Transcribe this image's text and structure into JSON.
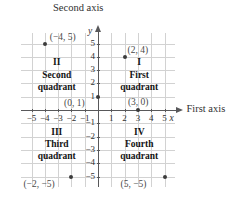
{
  "figure": {
    "type": "cartesian-coordinate-plane",
    "axis_titles": {
      "horizontal": "First axis",
      "vertical": "Second axis"
    },
    "axis_variables": {
      "horizontal": "x",
      "vertical": "y"
    }
  },
  "chart_data": {
    "type": "scatter",
    "title": "",
    "xlabel": "First axis",
    "ylabel": "Second axis",
    "x_variable": "x",
    "y_variable": "y",
    "xlim": [
      -5.8,
      5.8
    ],
    "ylim": [
      -5.8,
      5.8
    ],
    "grid": true,
    "legend": "none",
    "xticks": [
      -5,
      -4,
      -3,
      -2,
      -1,
      1,
      2,
      3,
      4,
      5
    ],
    "yticks": [
      5,
      4,
      3,
      2,
      1,
      -1,
      -2,
      -3,
      -4,
      -5
    ],
    "xtick_labels": [
      "−5",
      "−4",
      "−3",
      "−2",
      "−1",
      "1",
      "2",
      "3",
      "4",
      "5"
    ],
    "ytick_labels": [
      "5",
      "4",
      "3",
      "2",
      "1",
      "−1",
      "−2",
      "−3",
      "−4",
      "−5"
    ],
    "points": [
      {
        "x": -4,
        "y": 5,
        "label": "(−4, 5)",
        "label_pos": "right"
      },
      {
        "x": 2,
        "y": 4,
        "label": "(2, 4)",
        "label_pos": "upper-right"
      },
      {
        "x": 0,
        "y": 1,
        "label": "(0, 1)",
        "label_pos": "lower-left"
      },
      {
        "x": 3,
        "y": 0,
        "label": "(3, 0)",
        "label_pos": "upper-right"
      },
      {
        "x": -2,
        "y": -5,
        "label": "(−2, −5)",
        "label_pos": "lower-left"
      },
      {
        "x": 5,
        "y": -5,
        "label": "(5, −5)",
        "label_pos": "lower-left"
      }
    ],
    "annotations": [
      {
        "name": "quadrant-1",
        "numeral": "I",
        "line2": "First",
        "line3": "quadrant",
        "x": 3.1,
        "y": 2.6
      },
      {
        "name": "quadrant-2",
        "numeral": "II",
        "line2": "Second",
        "line3": "quadrant",
        "x": -3.1,
        "y": 2.6
      },
      {
        "name": "quadrant-3",
        "numeral": "III",
        "line2": "Third",
        "line3": "quadrant",
        "x": -3.1,
        "y": -2.6
      },
      {
        "name": "quadrant-4",
        "numeral": "IV",
        "line2": "Fourth",
        "line3": "quadrant",
        "x": 3.1,
        "y": -2.6
      }
    ],
    "colors": {
      "grid": "#d2d2d2",
      "axis": "#58585a",
      "point": "#3b3b3b",
      "text": "#303030",
      "label": "#4a4a4a"
    }
  }
}
